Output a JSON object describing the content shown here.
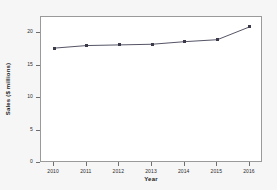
{
  "chart_data": {
    "type": "line",
    "title": "",
    "xlabel": "Year",
    "ylabel": "Sales ($ millions)",
    "x": [
      2010,
      2011,
      2012,
      2013,
      2014,
      2015,
      2016
    ],
    "xtick_labels": [
      "2010",
      "2011",
      "2012",
      "2013",
      "2014",
      "2015",
      "2016"
    ],
    "values": [
      17.7,
      18.1,
      18.2,
      18.3,
      18.7,
      19.0,
      21.0
    ],
    "ytick_labels": [
      "0",
      "5",
      "10",
      "15",
      "20"
    ],
    "yticks": [
      0,
      5,
      10,
      15,
      20
    ],
    "ylim": [
      0,
      22.5
    ],
    "xlim": [
      2009.6,
      2016.4
    ],
    "grid": false,
    "legend": null,
    "series": [
      {
        "name": "Sales",
        "values": [
          17.7,
          18.1,
          18.2,
          18.3,
          18.7,
          19.0,
          21.0
        ]
      }
    ],
    "marker": "square",
    "line_color": "#555566",
    "marker_color": "#3a3a4a",
    "plot_background": "#ffffff",
    "figure_background": "#f6f6f6",
    "frame_color": "#9a9a9a"
  }
}
